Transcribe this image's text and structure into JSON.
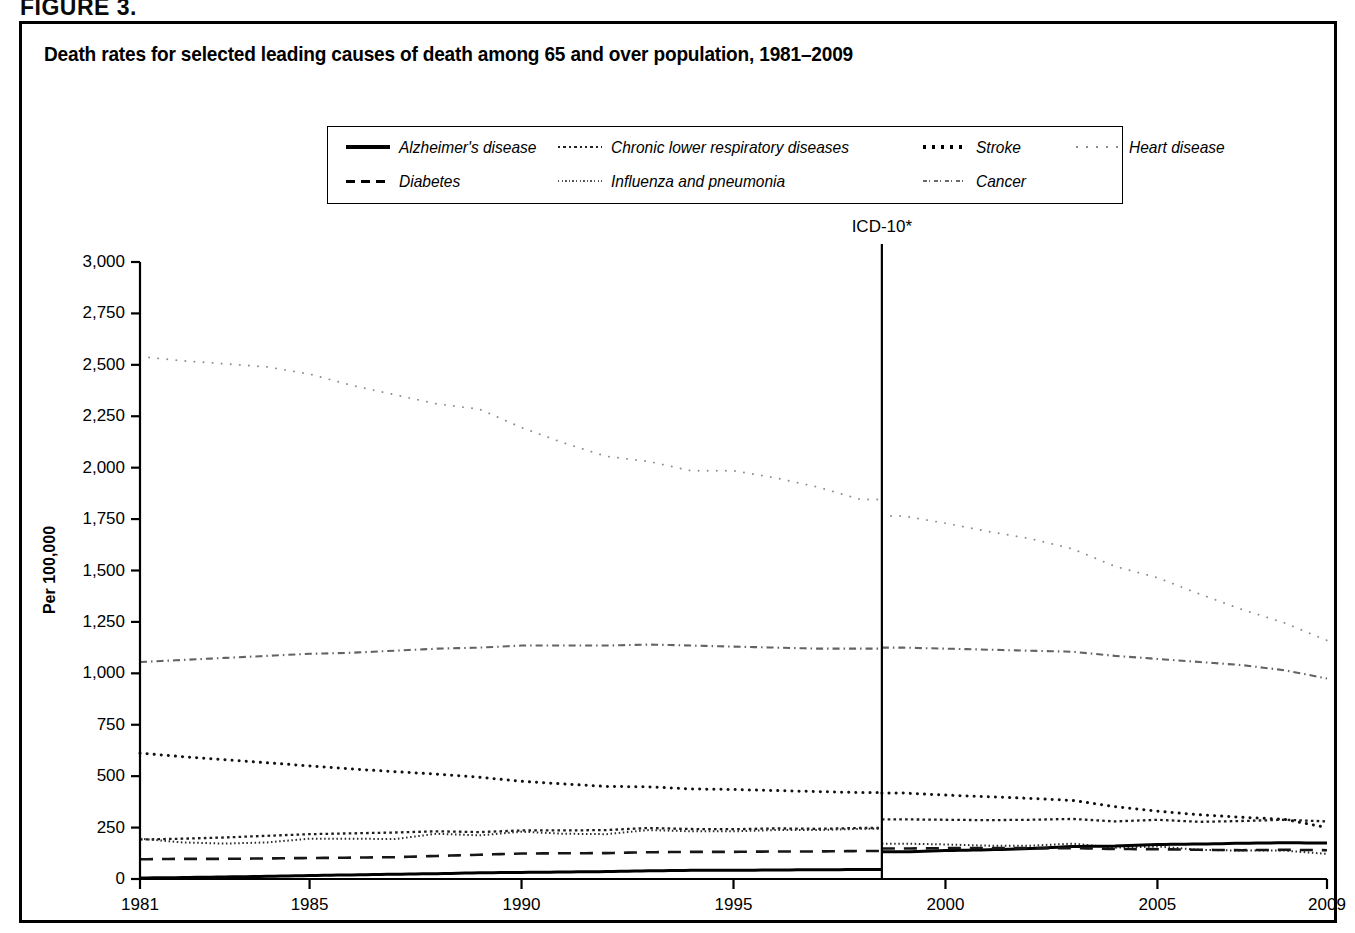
{
  "figure": {
    "label": "FIGURE 3.",
    "title": "Death rates for selected leading causes of death among 65 and over population, 1981–2009"
  },
  "annotation": {
    "icd_label": "ICD-10*",
    "icd_year": 1998.5
  },
  "chart_data": {
    "type": "line",
    "title": "Death rates for selected leading causes of death among 65 and over population, 1981–2009",
    "xlabel": "",
    "ylabel": "Per 100,000",
    "xlim": [
      1981,
      2009
    ],
    "ylim": [
      0,
      3000
    ],
    "ytick_labels": [
      "0",
      "250",
      "500",
      "750",
      "1,000",
      "1,250",
      "1,500",
      "1,750",
      "2,000",
      "2,250",
      "2,500",
      "2,750",
      "3,000"
    ],
    "ytick_values": [
      0,
      250,
      500,
      750,
      1000,
      1250,
      1500,
      1750,
      2000,
      2250,
      2500,
      2750,
      3000
    ],
    "xtick_labels": [
      "1981",
      "1985",
      "1990",
      "1995",
      "2000",
      "2005",
      "2009"
    ],
    "xtick_values": [
      1981,
      1985,
      1990,
      1995,
      2000,
      2005,
      2009
    ],
    "grid": false,
    "legend_position": "top-center",
    "x": [
      1981,
      1982,
      1983,
      1984,
      1985,
      1986,
      1987,
      1988,
      1989,
      1990,
      1991,
      1992,
      1993,
      1994,
      1995,
      1996,
      1997,
      1998,
      1999,
      2000,
      2001,
      2002,
      2003,
      2004,
      2005,
      2006,
      2007,
      2008,
      2009
    ],
    "series": [
      {
        "name": "Heart disease",
        "style": "sparse-dotted",
        "values": [
          2540,
          2520,
          2505,
          2490,
          2455,
          2400,
          2355,
          2310,
          2285,
          2195,
          2120,
          2055,
          2030,
          1985,
          1985,
          1950,
          1905,
          1845,
          1765,
          1730,
          1690,
          1655,
          1605,
          1520,
          1465,
          1385,
          1310,
          1245,
          1160
        ]
      },
      {
        "name": "Cancer",
        "style": "dash-dot-fine",
        "values": [
          1055,
          1065,
          1075,
          1085,
          1095,
          1100,
          1110,
          1120,
          1125,
          1135,
          1135,
          1135,
          1140,
          1135,
          1130,
          1125,
          1120,
          1120,
          1125,
          1120,
          1115,
          1110,
          1105,
          1085,
          1070,
          1055,
          1040,
          1015,
          975
        ]
      },
      {
        "name": "Stroke",
        "style": "dotted-round",
        "values": [
          612,
          595,
          580,
          565,
          550,
          535,
          522,
          510,
          495,
          475,
          462,
          450,
          448,
          438,
          435,
          430,
          425,
          420,
          418,
          408,
          400,
          392,
          382,
          352,
          330,
          312,
          300,
          290,
          250
        ]
      },
      {
        "name": "Chronic lower respiratory diseases",
        "style": "fine-dotted",
        "values": [
          192,
          196,
          202,
          210,
          218,
          222,
          226,
          232,
          228,
          236,
          236,
          238,
          248,
          243,
          242,
          246,
          244,
          248,
          290,
          288,
          286,
          288,
          292,
          280,
          288,
          278,
          282,
          288,
          280
        ]
      },
      {
        "name": "Influenza and pneumonia",
        "style": "micro-dotted",
        "values": [
          196,
          178,
          172,
          178,
          196,
          196,
          194,
          220,
          212,
          230,
          220,
          218,
          238,
          232,
          232,
          238,
          238,
          244,
          172,
          168,
          162,
          162,
          172,
          152,
          158,
          142,
          138,
          138,
          122
        ]
      },
      {
        "name": "Alzheimer's disease",
        "style": "solid",
        "values": [
          5,
          7,
          10,
          13,
          17,
          20,
          23,
          26,
          30,
          32,
          34,
          36,
          40,
          42,
          42,
          44,
          45,
          46,
          132,
          138,
          142,
          148,
          158,
          160,
          168,
          170,
          174,
          176,
          175
        ]
      },
      {
        "name": "Diabetes",
        "style": "dashed",
        "values": [
          96,
          98,
          98,
          100,
          102,
          104,
          106,
          112,
          118,
          124,
          125,
          126,
          130,
          132,
          132,
          134,
          134,
          136,
          148,
          150,
          150,
          150,
          150,
          146,
          145,
          142,
          140,
          142,
          140
        ]
      }
    ]
  },
  "legend": {
    "row1": [
      {
        "label": "Alzheimer's disease",
        "style": "solid"
      },
      {
        "label": "Chronic lower respiratory diseases",
        "style": "fine-dotted"
      },
      {
        "label": "Stroke",
        "style": "dotted-round"
      },
      {
        "label": "Heart disease",
        "style": "sparse-dotted"
      }
    ],
    "row2": [
      {
        "label": "Diabetes",
        "style": "dashed"
      },
      {
        "label": "Influenza and pneumonia",
        "style": "micro-dotted"
      },
      {
        "label": "Cancer",
        "style": "dash-dot-fine"
      }
    ]
  },
  "colors": {
    "ink": "#000000",
    "background": "#ffffff",
    "faint": "#9a9a9a"
  }
}
